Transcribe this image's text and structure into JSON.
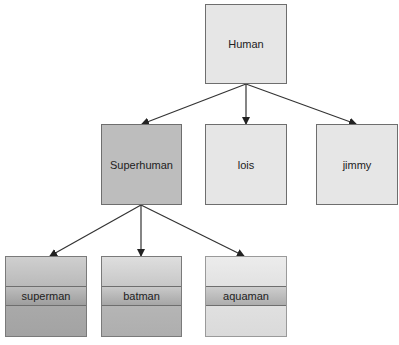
{
  "diagram": {
    "type": "class-hierarchy-tree",
    "root": {
      "label": "Human"
    },
    "level1": [
      {
        "label": "Superhuman"
      },
      {
        "label": "lois"
      },
      {
        "label": "jimmy"
      }
    ],
    "level2": [
      {
        "label": "superman"
      },
      {
        "label": "batman"
      },
      {
        "label": "aquaman"
      }
    ],
    "edges": [
      {
        "from": "Human",
        "to": "Superhuman"
      },
      {
        "from": "Human",
        "to": "lois"
      },
      {
        "from": "Human",
        "to": "jimmy"
      },
      {
        "from": "Superhuman",
        "to": "superman"
      },
      {
        "from": "Superhuman",
        "to": "batman"
      },
      {
        "from": "Superhuman",
        "to": "aquaman"
      }
    ],
    "colors": {
      "light_box": "#e6e6e6",
      "dark_box": "#bdbdbd",
      "leaf_dark": "#b5b5b5",
      "leaf_mid": "#c4c4c4",
      "leaf_light": "#e3e3e3",
      "edge": "#333333"
    }
  }
}
